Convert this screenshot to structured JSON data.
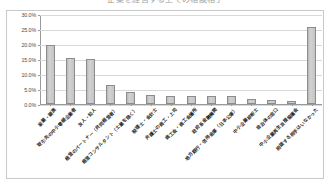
{
  "title": "企業を経営する上での相談相手",
  "chart_data": {
    "type": "bar",
    "title": "企業を経営する上での相談相手",
    "xlabel": "",
    "ylabel": "",
    "ylim": [
      0,
      30
    ],
    "grid": true,
    "legend": "none",
    "ytick_labels": [
      "30.0%",
      "25.0%",
      "20.0%",
      "15.0%",
      "10.0%",
      "5.0%",
      "0.0%"
    ],
    "ytick_values": [
      30,
      25,
      20,
      15,
      10,
      5,
      0
    ],
    "categories": [
      "家業・親族",
      "取引先の中小零細企業者",
      "友人・知人",
      "経営のパートナー（共同経営者）",
      "経営コンサルタント（士業を除く）",
      "税理士・会計士",
      "弁護士の商工・上司",
      "商工会・商工会議所",
      "政府系金融機関",
      "地方銀行・信用金庫（日本公庫）",
      "中小企業診断士",
      "自治体の窓口",
      "中小企業再生支援協議会",
      "相談する相手はいなかった"
    ],
    "values": [
      19.8,
      15.3,
      15.0,
      6.3,
      4.0,
      3.0,
      2.7,
      2.6,
      2.6,
      2.6,
      1.7,
      1.5,
      1.1,
      25.8
    ],
    "value_labels": [
      "19.8%",
      "15.3%",
      "15.0%",
      "6.3%",
      "4.0%",
      "3.0%",
      "2.7%",
      "2.6%",
      "2.6%",
      "2.6%",
      "1.7%",
      "1.5%",
      "1.1%",
      "25.8%"
    ]
  },
  "colors": {
    "bar_fill": "#d2d2d2",
    "bar_border": "#8c8c8c",
    "gridline": "#d8d8d8",
    "axis": "#9a9a9a",
    "frame": "#c9c9c9",
    "text": "#1f1f1f",
    "background": "#ffffff"
  }
}
